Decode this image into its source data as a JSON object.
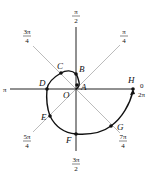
{
  "diagram": {
    "type": "polar spiral r = theta",
    "points": [
      {
        "id": "A",
        "label": "A",
        "x": 77,
        "y": 85,
        "lx": 81,
        "ly": 90
      },
      {
        "id": "B",
        "label": "B",
        "x": 76,
        "y": 74,
        "lx": 79,
        "ly": 72
      },
      {
        "id": "C",
        "label": "C",
        "x": 61,
        "y": 73,
        "lx": 57,
        "ly": 69
      },
      {
        "id": "D",
        "label": "D",
        "x": 47,
        "y": 89,
        "lx": 39,
        "ly": 86
      },
      {
        "id": "E",
        "label": "E",
        "x": 50,
        "y": 116,
        "lx": 41,
        "ly": 120
      },
      {
        "id": "F",
        "label": "F",
        "x": 76,
        "y": 134,
        "lx": 66,
        "ly": 143
      },
      {
        "id": "G",
        "label": "G",
        "x": 111,
        "y": 126,
        "lx": 117,
        "ly": 130
      },
      {
        "id": "H",
        "label": "H",
        "x": 133,
        "y": 89,
        "lx": 128,
        "ly": 83
      }
    ],
    "origin": {
      "label": "O",
      "x": 76,
      "y": 89
    },
    "angle_labels": [
      {
        "num": "π",
        "den": "2",
        "x": 76,
        "y": 15
      },
      {
        "num": "π",
        "den": "4",
        "x": 124,
        "y": 35
      },
      {
        "num": "3π",
        "den": "4",
        "x": 27,
        "y": 35
      },
      {
        "num": "5π",
        "den": "4",
        "x": 27,
        "y": 140
      },
      {
        "num": "7π",
        "den": "4",
        "x": 123,
        "y": 140
      },
      {
        "num": "3π",
        "den": "2",
        "x": 76,
        "y": 163
      }
    ],
    "pi_label": "π",
    "zero_label": "0",
    "two_pi_label": "2π"
  }
}
